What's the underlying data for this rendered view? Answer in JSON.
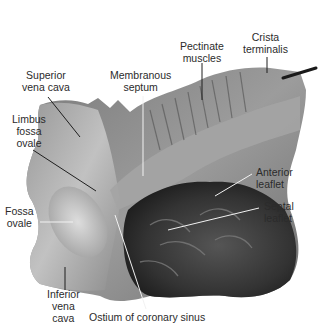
{
  "figure": {
    "colors": {
      "background": "#ffffff",
      "tissue_light": "#bdbdbd",
      "tissue_mid": "#8a8a8a",
      "tissue_dark": "#4a4a4a",
      "tissue_darkest": "#262626",
      "label_text": "#2b2b2b",
      "leader_dark": "#1e1e1e",
      "leader_light": "#f2f2f2"
    },
    "labels": [
      {
        "id": "superior-vena-cava",
        "lines": [
          "Superior",
          "vena cava"
        ]
      },
      {
        "id": "membranous-septum",
        "lines": [
          "Membranous",
          "septum"
        ]
      },
      {
        "id": "pectinate-muscles",
        "lines": [
          "Pectinate",
          "muscles"
        ]
      },
      {
        "id": "crista-terminalis",
        "lines": [
          "Crista",
          "terminalis"
        ]
      },
      {
        "id": "limbus-fossa-ovale",
        "lines": [
          "Limbus",
          "fossa",
          "ovale"
        ]
      },
      {
        "id": "anterior-leaflet",
        "lines": [
          "Anterior",
          "leaflet"
        ]
      },
      {
        "id": "septal-leaflet",
        "lines": [
          "Septal",
          "leaflet"
        ]
      },
      {
        "id": "fossa-ovale",
        "lines": [
          "Fossa",
          "ovale"
        ]
      },
      {
        "id": "inferior-vena-cava",
        "lines": [
          "Inferior",
          "vena",
          "cava"
        ]
      },
      {
        "id": "ostium-coronary-sinus",
        "lines": [
          "Ostium of coronary sinus"
        ]
      }
    ]
  }
}
